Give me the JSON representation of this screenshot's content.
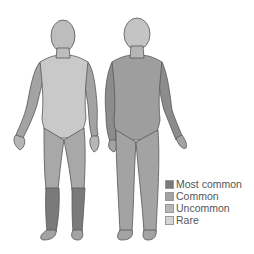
{
  "figure": {
    "views": [
      "front",
      "back"
    ],
    "colors": {
      "most_common": "#7a7a7a",
      "common": "#a3a3a3",
      "uncommon": "#b6b6b6",
      "rare": "#d4d4d4",
      "outline": "#555555"
    }
  },
  "legend": {
    "items": [
      {
        "label": "Most common",
        "color": "#7a7a7a"
      },
      {
        "label": "Common",
        "color": "#a3a3a3"
      },
      {
        "label": "Uncommon",
        "color": "#b6b6b6"
      },
      {
        "label": "Rare",
        "color": "#d4d4d4"
      }
    ]
  }
}
